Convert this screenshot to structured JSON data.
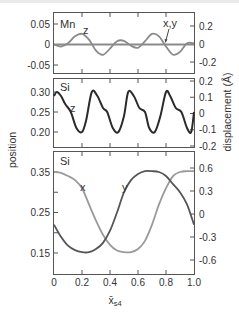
{
  "chart_data": [
    {
      "type": "line",
      "panel": "top",
      "title": "",
      "annotations": [
        "Mn",
        "z",
        "x,y"
      ],
      "xlabel": "",
      "ylabel_left": "position",
      "ylabel_right": "displacement (Å)",
      "xlim": [
        0,
        1.0
      ],
      "ylim_left": [
        -0.065,
        0.065
      ],
      "ylim_right": [
        -0.26,
        0.26
      ],
      "left_ticks": [
        0.05,
        0,
        -0.05
      ],
      "left_tick_labels": [
        "0.05",
        "0",
        "-0.05"
      ],
      "right_ticks": [
        0.2,
        0,
        -0.2
      ],
      "right_tick_labels": [
        "0.2",
        "0",
        "-0.2"
      ],
      "series": [
        {
          "name": "z",
          "color": "#8a8a8a",
          "x": [
            0,
            0.05,
            0.1,
            0.15,
            0.2,
            0.25,
            0.3,
            0.35,
            0.4,
            0.45,
            0.5,
            0.55,
            0.6,
            0.65,
            0.7,
            0.75,
            0.8,
            0.85,
            0.9,
            0.95,
            1.0
          ],
          "values": [
            0,
            -0.005,
            0.003,
            0.02,
            0.026,
            0.012,
            -0.015,
            -0.025,
            -0.01,
            0.008,
            0.009,
            -0.003,
            -0.008,
            0.008,
            0.026,
            0.02,
            -0.005,
            -0.025,
            -0.018,
            0.003,
            0.003
          ]
        },
        {
          "name": "x,y",
          "color": "#8a8a8a",
          "x": [
            0,
            1.0
          ],
          "values": [
            0,
            0
          ]
        }
      ]
    },
    {
      "type": "line",
      "panel": "middle",
      "annotations": [
        "Si",
        "z"
      ],
      "xlim": [
        0,
        1.0
      ],
      "ylim_left": [
        0.17,
        0.33
      ],
      "ylim_right": [
        -0.2,
        0.2
      ],
      "left_ticks": [
        0.3,
        0.25,
        0.2
      ],
      "left_tick_labels": [
        "0.30",
        "0.25",
        "0.20"
      ],
      "right_ticks": [
        0.2,
        0.1,
        0,
        -0.1,
        -0.2
      ],
      "right_tick_labels": [
        "0.2",
        "0.1",
        "0",
        "-0.1",
        "-0.2"
      ],
      "series": [
        {
          "name": "z",
          "color": "#2b2b2b",
          "x": [
            0,
            0.02,
            0.05,
            0.08,
            0.12,
            0.16,
            0.2,
            0.23,
            0.27,
            0.31,
            0.35,
            0.38,
            0.42,
            0.46,
            0.5,
            0.53,
            0.57,
            0.61,
            0.65,
            0.68,
            0.72,
            0.76,
            0.8,
            0.83,
            0.87,
            0.91,
            0.95,
            0.98,
            1.0
          ],
          "values": [
            0.29,
            0.3,
            0.29,
            0.27,
            0.25,
            0.21,
            0.2,
            0.23,
            0.3,
            0.29,
            0.26,
            0.25,
            0.21,
            0.2,
            0.24,
            0.3,
            0.29,
            0.26,
            0.25,
            0.21,
            0.2,
            0.24,
            0.3,
            0.29,
            0.26,
            0.25,
            0.21,
            0.2,
            0.25
          ]
        }
      ]
    },
    {
      "type": "line",
      "panel": "bottom",
      "annotations": [
        "Si",
        "x",
        "y"
      ],
      "xlabel": "x̄s4",
      "xlim": [
        0,
        1.0
      ],
      "x_ticks": [
        0,
        0.2,
        0.4,
        0.6,
        0.8,
        1.0
      ],
      "x_tick_labels": [
        "0",
        "0.2",
        "0.4",
        "0.6",
        "0.8",
        "1.0"
      ],
      "ylim_left": [
        0.12,
        0.4
      ],
      "ylim_right": [
        -0.8,
        0.8
      ],
      "left_ticks": [
        0.35,
        0.3,
        0.25,
        0.2,
        0.15
      ],
      "left_tick_labels": [
        "0.35",
        "",
        "0.25",
        "",
        "0.15"
      ],
      "right_ticks": [
        0.6,
        0.3,
        0,
        -0.3,
        -0.6
      ],
      "right_tick_labels": [
        "0.6",
        "0.3",
        "0",
        "-0.3",
        "-0.6"
      ],
      "series": [
        {
          "name": "x",
          "color": "#9a9a9a",
          "x": [
            0,
            0.05,
            0.1,
            0.15,
            0.2,
            0.25,
            0.3,
            0.35,
            0.4,
            0.45,
            0.5,
            0.55,
            0.6,
            0.65,
            0.7,
            0.75,
            0.8,
            0.85,
            0.9,
            0.95,
            1.0
          ],
          "values": [
            0.35,
            0.348,
            0.34,
            0.33,
            0.31,
            0.27,
            0.23,
            0.195,
            0.17,
            0.156,
            0.152,
            0.152,
            0.16,
            0.18,
            0.22,
            0.27,
            0.31,
            0.34,
            0.35,
            0.352,
            0.352
          ]
        },
        {
          "name": "y",
          "color": "#555555",
          "x": [
            0,
            0.05,
            0.1,
            0.15,
            0.2,
            0.25,
            0.3,
            0.35,
            0.4,
            0.45,
            0.5,
            0.55,
            0.6,
            0.65,
            0.7,
            0.75,
            0.8,
            0.85,
            0.9,
            0.95,
            1.0
          ],
          "values": [
            0.22,
            0.19,
            0.168,
            0.157,
            0.152,
            0.152,
            0.16,
            0.175,
            0.205,
            0.25,
            0.3,
            0.33,
            0.345,
            0.352,
            0.352,
            0.35,
            0.34,
            0.32,
            0.3,
            0.27,
            0.22
          ]
        }
      ]
    }
  ],
  "labels": {
    "y_left": "position",
    "y_right": "displacement (Å)",
    "x_main": "x̄",
    "x_sub": "s4",
    "top_element": "Mn",
    "top_z": "z",
    "top_xy": "x,y",
    "mid_element": "Si",
    "mid_z": "z",
    "bot_element": "Si",
    "bot_x": "x",
    "bot_y": "y"
  }
}
